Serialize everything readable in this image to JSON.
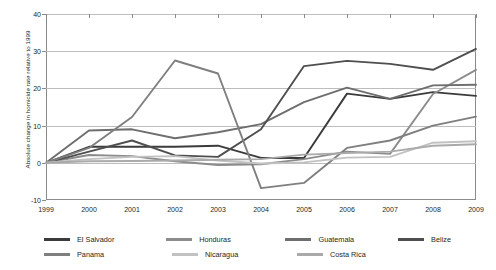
{
  "chart_data": {
    "type": "line",
    "title": "",
    "xlabel": "",
    "ylabel": "Absolute change in homicide rate relative to 1999",
    "x": [
      1999,
      2000,
      2001,
      2002,
      2003,
      2004,
      2005,
      2006,
      2007,
      2008,
      2009
    ],
    "xtick_labels": [
      "1999",
      "2000",
      "2001",
      "2002",
      "2003",
      "2004",
      "2005",
      "2006",
      "2007",
      "2008",
      "2009"
    ],
    "ytick_labels": [
      "40",
      "30",
      "20",
      "10",
      "0",
      "-10"
    ],
    "yticks": [
      40,
      30,
      20,
      10,
      0,
      -10
    ],
    "ylim": [
      -10,
      40
    ],
    "xlim": [
      1999,
      2009
    ],
    "grid": true,
    "legend_position": "bottom",
    "series": [
      {
        "name": "El Salvador",
        "color": "#3b3b3b",
        "values": [
          0,
          4.3,
          4.3,
          4.3,
          4.6,
          1.3,
          1.3,
          18.6,
          17.2,
          19.0,
          18.0
        ]
      },
      {
        "name": "Honduras",
        "color": "#8c8c8c",
        "values": [
          0,
          2.1,
          1.8,
          0.4,
          -0.6,
          -0.4,
          1.0,
          3.0,
          2.4,
          18.5,
          25.0
        ]
      },
      {
        "name": "Guatemala",
        "color": "#6e6e6e",
        "values": [
          0,
          8.7,
          9.0,
          6.6,
          8.2,
          10.4,
          16.3,
          20.2,
          17.2,
          20.8,
          21.0
        ]
      },
      {
        "name": "Belize",
        "color": "#4f4f4f",
        "values": [
          0,
          3.0,
          6.0,
          2.0,
          1.6,
          9.0,
          26.0,
          27.4,
          26.6,
          25.0,
          30.6
        ]
      },
      {
        "name": "Panama",
        "color": "#7f7f7f",
        "values": [
          0,
          4.0,
          12.3,
          27.5,
          24.0,
          -6.8,
          -5.4,
          4.0,
          6.0,
          10.0,
          12.4
        ]
      },
      {
        "name": "Nicaragua",
        "color": "#c2c2c2",
        "values": [
          0,
          1.0,
          1.6,
          1.8,
          0.6,
          -0.2,
          0.1,
          1.4,
          1.6,
          5.4,
          5.8
        ]
      },
      {
        "name": "Costa Rica",
        "color": "#aaaaaa",
        "values": [
          0,
          0.4,
          0.5,
          0.6,
          0.8,
          1.0,
          2.2,
          2.6,
          3.0,
          4.6,
          5.0
        ]
      }
    ]
  },
  "legend": {
    "rows": [
      [
        {
          "label": "El Salvador",
          "color": "#3b3b3b"
        },
        {
          "label": "Honduras",
          "color": "#8c8c8c"
        },
        {
          "label": "Guatemala",
          "color": "#6e6e6e"
        },
        {
          "label": "Belize",
          "color": "#4f4f4f"
        }
      ],
      [
        {
          "label": "Panama",
          "color": "#7f7f7f"
        },
        {
          "label": "Nicaragua",
          "color": "#c2c2c2"
        },
        {
          "label": "Costa Rica",
          "color": "#aaaaaa"
        }
      ]
    ]
  }
}
